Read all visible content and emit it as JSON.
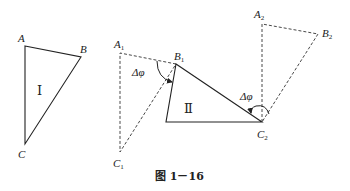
{
  "figure": {
    "caption": "图 1－16",
    "triangle_1": {
      "roman_label": "Ⅰ",
      "vertices": {
        "A": "A",
        "B": "B",
        "C": "C"
      }
    },
    "rotation_1": {
      "vertices": {
        "A": "A",
        "A_sub": "1",
        "B": "B",
        "B_sub": "1",
        "C": "C",
        "C_sub": "1"
      },
      "angle_label": "Δφ"
    },
    "triangle_2": {
      "roman_label": "Ⅱ"
    },
    "rotation_2": {
      "vertices": {
        "A": "A",
        "A_sub": "2",
        "B": "B",
        "B_sub": "2",
        "C": "C",
        "C_sub": "2"
      },
      "angle_label": "Δφ"
    }
  }
}
